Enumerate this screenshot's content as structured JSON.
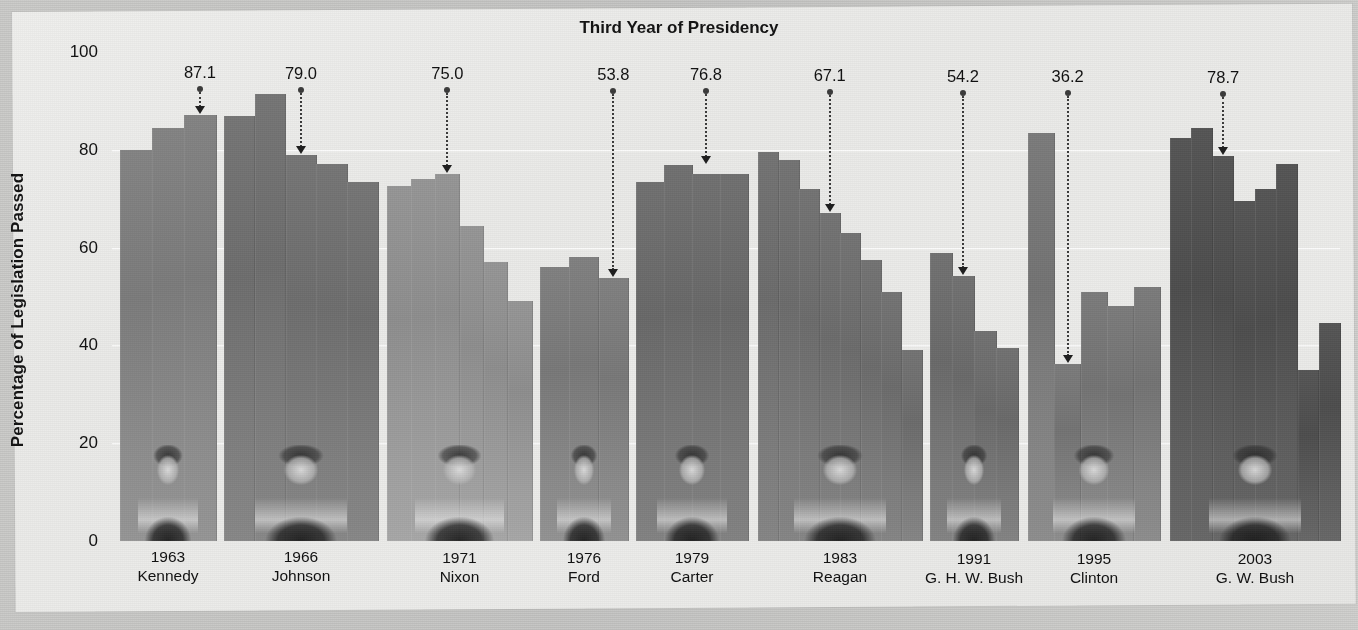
{
  "chart_data": {
    "type": "bar",
    "title": "Third Year of Presidency",
    "xlabel": "",
    "ylabel": "Percentage of Legislation Passed",
    "ylim": [
      0,
      100
    ],
    "yticks": [
      0,
      20,
      40,
      60,
      80,
      100
    ],
    "grid": true,
    "legend": false,
    "note": "Each president group shows one bar per year in office; the labeled bar is the third year of that presidency.",
    "groups": [
      {
        "president": "Kennedy",
        "year": "1963",
        "highlight_value": 87.1,
        "highlight_index": 2,
        "shade": "#7d7d7d",
        "values": [
          80.0,
          84.5,
          87.1
        ]
      },
      {
        "president": "Johnson",
        "year": "1966",
        "highlight_value": 79.0,
        "highlight_index": 2,
        "shade": "#6f6f6f",
        "values": [
          87.0,
          91.5,
          79.0,
          77.0,
          73.5
        ]
      },
      {
        "president": "Nixon",
        "year": "1971",
        "highlight_value": 75.0,
        "highlight_index": 2,
        "shade": "#8f8f8f",
        "values": [
          72.5,
          74.0,
          75.0,
          64.5,
          57.0,
          49.0
        ]
      },
      {
        "president": "Ford",
        "year": "1976",
        "highlight_value": 53.8,
        "highlight_index": 2,
        "shade": "#7a7a7a",
        "values": [
          56.0,
          58.0,
          53.8
        ]
      },
      {
        "president": "Carter",
        "year": "1979",
        "highlight_value": 76.8,
        "highlight_index": 2,
        "shade": "#6a6a6a",
        "values": [
          73.5,
          76.8,
          75.0,
          75.0
        ]
      },
      {
        "president": "Reagan",
        "year": "1983",
        "highlight_value": 67.1,
        "highlight_index": 3,
        "shade": "#6d6d6d",
        "values": [
          79.5,
          78.0,
          72.0,
          67.1,
          63.0,
          57.5,
          51.0,
          39.0
        ]
      },
      {
        "president": "G. H. W. Bush",
        "year": "1991",
        "highlight_value": 54.2,
        "highlight_index": 1,
        "shade": "#6b6b6b",
        "values": [
          59.0,
          54.2,
          43.0,
          39.5
        ]
      },
      {
        "president": "Clinton",
        "year": "1995",
        "highlight_value": 36.2,
        "highlight_index": 1,
        "shade": "#757575",
        "values": [
          83.5,
          36.2,
          51.0,
          48.0,
          52.0
        ]
      },
      {
        "president": "G. W. Bush",
        "year": "2003",
        "highlight_value": 78.7,
        "highlight_index": 2,
        "shade": "#4f4f4f",
        "values": [
          82.5,
          84.5,
          78.7,
          69.5,
          72.0,
          77.0,
          35.0,
          44.5
        ]
      }
    ]
  },
  "axis": {
    "y_tick_labels": [
      "100",
      "80",
      "60",
      "40",
      "20",
      "0"
    ]
  }
}
